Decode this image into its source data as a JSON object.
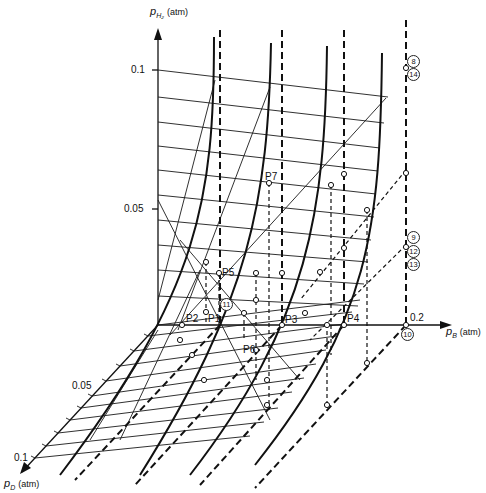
{
  "axes": {
    "vertical": {
      "symbol": "p",
      "subscript": "H₂",
      "unit": "(atm)",
      "ticks": [
        "0.1",
        "0.05"
      ]
    },
    "horizontal": {
      "symbol": "p",
      "subscript": "B",
      "unit": "(atm)",
      "end_tick": "0.2"
    },
    "depth": {
      "symbol": "p",
      "subscript": "D",
      "unit": "(atm)",
      "ticks": [
        "0.05",
        "0.1"
      ]
    }
  },
  "point_labels": {
    "p1": "P1",
    "p2": "P2",
    "p3": "P3",
    "p4": "P4",
    "p5": "P5",
    "p6": "P6",
    "p7": "P7"
  },
  "circled_labels": {
    "c8": "8",
    "c9": "9",
    "c10": "10",
    "c11": "11",
    "c12": "12",
    "c13": "13",
    "c14": "14"
  }
}
